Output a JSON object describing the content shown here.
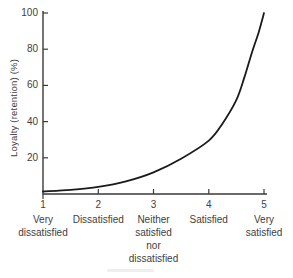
{
  "chart_data": {
    "type": "line",
    "title": "",
    "ylabel": "Loyalty (retention) (%)",
    "xlabel": "",
    "x_ticks": [
      1,
      2,
      3,
      4,
      5
    ],
    "x_tick_labels": [
      [
        "Very",
        "dissatisfied"
      ],
      [
        "Dissatisfied"
      ],
      [
        "Neither",
        "satisfied",
        "nor",
        "dissatisfied"
      ],
      [
        "Satisfied"
      ],
      [
        "Very",
        "satisfied"
      ]
    ],
    "y_ticks": [
      20,
      40,
      60,
      80,
      100
    ],
    "xlim": [
      1,
      5
    ],
    "ylim": [
      0,
      100
    ],
    "grid": false,
    "legend": "none",
    "series": [
      {
        "name": "loyalty-retention-curve",
        "points": [
          [
            1,
            1.4
          ],
          [
            1.5,
            2.3
          ],
          [
            2,
            3.9
          ],
          [
            2.5,
            7
          ],
          [
            3,
            12
          ],
          [
            3.5,
            19.5
          ],
          [
            4,
            29.5
          ],
          [
            4.25,
            39
          ],
          [
            4.5,
            52
          ],
          [
            4.65,
            65
          ],
          [
            4.8,
            80
          ],
          [
            4.9,
            89
          ],
          [
            5,
            100
          ]
        ]
      }
    ],
    "colors": {
      "curve": "#1a1a1a",
      "axis": "#3a3a3a",
      "text": "#414141"
    }
  }
}
